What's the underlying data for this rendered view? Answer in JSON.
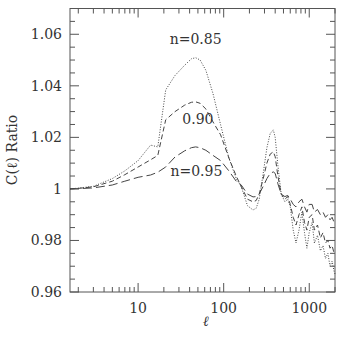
{
  "chart_data": {
    "type": "line",
    "title": "",
    "xlabel": "ℓ",
    "ylabel": "C(ℓ) Ratio",
    "xscale": "log",
    "xlim": [
      1.6,
      2000
    ],
    "ylim": [
      0.96,
      1.07
    ],
    "grid": false,
    "legend": "none (inline annotations)",
    "x_ticks": [
      {
        "value": 10,
        "label": "10"
      },
      {
        "value": 100,
        "label": "100"
      },
      {
        "value": 1000,
        "label": "1000"
      }
    ],
    "y_ticks": [
      {
        "value": 0.96,
        "label": "0.96"
      },
      {
        "value": 0.98,
        "label": "0.98"
      },
      {
        "value": 1.0,
        "label": "1"
      },
      {
        "value": 1.02,
        "label": "1.02"
      },
      {
        "value": 1.04,
        "label": "1.04"
      },
      {
        "value": 1.06,
        "label": "1.06"
      }
    ],
    "annotations": [
      {
        "text": "n=0.85",
        "x": 47,
        "y": 1.058
      },
      {
        "text": "0.90",
        "x": 50,
        "y": 1.027
      },
      {
        "text": "n=0.95",
        "x": 48,
        "y": 1.007
      }
    ],
    "series": [
      {
        "name": "n=0.85",
        "style": "dotted",
        "x": [
          1.6,
          2,
          3,
          5,
          7,
          10,
          14,
          17,
          21,
          27,
          35,
          42,
          47,
          53,
          62,
          75,
          92,
          115,
          140,
          160,
          190,
          220,
          240,
          260,
          290,
          320,
          350,
          380,
          400,
          430,
          470,
          520,
          560,
          600,
          650,
          700,
          760,
          820,
          880,
          940,
          1000,
          1080,
          1150,
          1250,
          1350,
          1450,
          1550,
          1650,
          1750,
          1850,
          1950,
          2000
        ],
        "y": [
          1.0,
          1.0003,
          1.001,
          1.004,
          1.007,
          1.011,
          1.017,
          1.0163,
          1.0384,
          1.044,
          1.048,
          1.0505,
          1.0509,
          1.05,
          1.046,
          1.037,
          1.0249,
          1.012,
          1.004,
          1.001,
          0.9935,
          0.9918,
          0.9925,
          0.996,
          1.006,
          1.016,
          1.0215,
          1.0229,
          1.02,
          1.009,
          0.998,
          0.995,
          0.996,
          0.993,
          0.984,
          0.979,
          0.984,
          0.991,
          0.983,
          0.977,
          0.983,
          0.987,
          0.979,
          0.982,
          0.976,
          0.978,
          0.973,
          0.975,
          0.97,
          0.972,
          0.968,
          0.967
        ]
      },
      {
        "name": "n=0.90",
        "style": "dashed",
        "x": [
          1.6,
          2,
          3,
          5,
          7,
          10,
          14,
          17,
          21,
          27,
          35,
          42,
          47,
          53,
          62,
          75,
          92,
          115,
          140,
          160,
          190,
          220,
          240,
          260,
          290,
          320,
          350,
          380,
          400,
          430,
          470,
          520,
          560,
          600,
          650,
          700,
          760,
          820,
          880,
          940,
          1000,
          1080,
          1150,
          1250,
          1350,
          1450,
          1550,
          1650,
          1750,
          1850,
          1950,
          2000
        ],
        "y": [
          1.0,
          1.0002,
          1.0008,
          1.003,
          1.0055,
          1.0085,
          1.0113,
          1.013,
          1.0268,
          1.03,
          1.0325,
          1.0336,
          1.0338,
          1.0332,
          1.031,
          1.026,
          1.021,
          1.012,
          1.005,
          1.001,
          0.996,
          0.995,
          0.9955,
          0.998,
          1.004,
          1.01,
          1.0135,
          1.0144,
          1.0125,
          1.005,
          0.998,
          0.996,
          0.997,
          0.994,
          0.989,
          0.986,
          0.99,
          0.993,
          0.987,
          0.984,
          0.989,
          0.99,
          0.984,
          0.986,
          0.981,
          0.983,
          0.979,
          0.98,
          0.977,
          0.978,
          0.975,
          0.975
        ]
      },
      {
        "name": "n=0.95",
        "style": "long-dashed",
        "x": [
          1.6,
          2,
          3,
          5,
          7,
          10,
          14,
          17,
          21,
          27,
          35,
          42,
          47,
          53,
          62,
          75,
          92,
          115,
          140,
          160,
          190,
          220,
          240,
          260,
          290,
          320,
          350,
          380,
          400,
          430,
          470,
          520,
          560,
          600,
          650,
          700,
          760,
          820,
          880,
          940,
          1000,
          1080,
          1150,
          1250,
          1350,
          1450,
          1550,
          1650,
          1750,
          1850,
          1950,
          2000
        ],
        "y": [
          1.0,
          1.0001,
          1.0004,
          1.0015,
          1.003,
          1.0045,
          1.0054,
          1.0065,
          1.0085,
          1.0124,
          1.0148,
          1.016,
          1.0163,
          1.016,
          1.015,
          1.013,
          1.011,
          1.007,
          1.003,
          1.0016,
          0.998,
          0.9969,
          0.997,
          0.998,
          1.001,
          1.004,
          1.006,
          1.0066,
          1.006,
          1.002,
          0.998,
          0.997,
          0.9975,
          0.996,
          0.994,
          0.993,
          0.995,
          0.996,
          0.993,
          0.991,
          0.994,
          0.994,
          0.991,
          0.992,
          0.99,
          0.991,
          0.989,
          0.99,
          0.988,
          0.989,
          0.987,
          0.987
        ]
      }
    ]
  }
}
